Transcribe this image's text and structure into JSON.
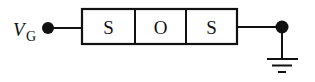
{
  "diagram": {
    "type": "circuit-schematic",
    "input_label": {
      "main": "V",
      "subscript": "G"
    },
    "layers": [
      {
        "label": "S"
      },
      {
        "label": "O"
      },
      {
        "label": "S"
      }
    ],
    "terminals": {
      "left": "input-node",
      "right": "output-node-to-ground"
    },
    "ground": "ground-symbol",
    "colors": {
      "stroke": "#111111",
      "background": "#ffffff"
    }
  }
}
